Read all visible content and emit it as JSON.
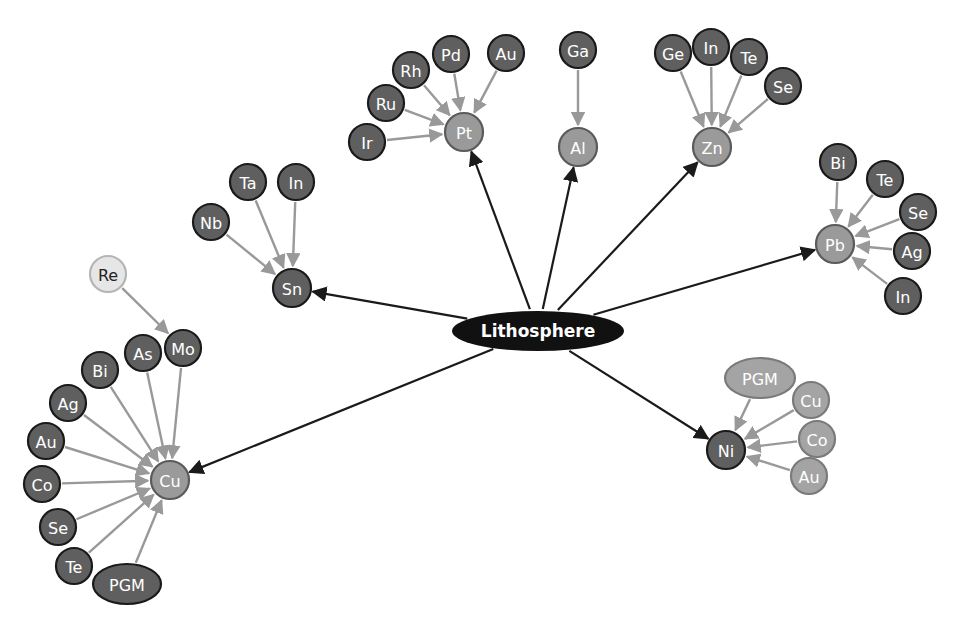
{
  "colors": {
    "hub_fill": "#111111",
    "primary_fill": "#9a9a9a",
    "primary_stroke": "#5a5a5a",
    "byproduct_dark_fill": "#5f5f5f",
    "byproduct_light_fill": "#a4a4a4",
    "byproduct_lighter_fill": "#e6e6e6",
    "node_stroke": "#1a1a1a",
    "hub_edge": "#1a1a1a",
    "child_edge": "#999999"
  },
  "hub": {
    "id": "lithosphere",
    "label": "Lithosphere",
    "x": 538,
    "y": 331,
    "rx": 86,
    "ry": 20
  },
  "primary_metals": [
    {
      "id": "pt",
      "label": "Pt",
      "x": 464,
      "y": 132,
      "r": 19,
      "style": "primary"
    },
    {
      "id": "al",
      "label": "Al",
      "x": 578,
      "y": 147,
      "r": 19,
      "style": "primary"
    },
    {
      "id": "zn",
      "label": "Zn",
      "x": 712,
      "y": 147,
      "r": 19,
      "style": "primary"
    },
    {
      "id": "pb",
      "label": "Pb",
      "x": 835,
      "y": 244,
      "r": 19,
      "style": "primary"
    },
    {
      "id": "ni",
      "label": "Ni",
      "x": 726,
      "y": 450,
      "r": 19,
      "style": "dark"
    },
    {
      "id": "cu",
      "label": "Cu",
      "x": 170,
      "y": 480,
      "r": 19,
      "style": "primary"
    },
    {
      "id": "sn",
      "label": "Sn",
      "x": 292,
      "y": 288,
      "r": 19,
      "style": "dark"
    }
  ],
  "byproducts": [
    {
      "parent": "pt",
      "label": "Ir",
      "x": 367,
      "y": 142,
      "style": "dark"
    },
    {
      "parent": "pt",
      "label": "Ru",
      "x": 386,
      "y": 103,
      "style": "dark"
    },
    {
      "parent": "pt",
      "label": "Rh",
      "x": 411,
      "y": 70,
      "style": "dark"
    },
    {
      "parent": "pt",
      "label": "Pd",
      "x": 451,
      "y": 54,
      "style": "dark"
    },
    {
      "parent": "pt",
      "label": "Au",
      "x": 506,
      "y": 53,
      "style": "dark"
    },
    {
      "parent": "al",
      "label": "Ga",
      "x": 578,
      "y": 50,
      "style": "dark"
    },
    {
      "parent": "zn",
      "label": "Ge",
      "x": 673,
      "y": 53,
      "style": "dark"
    },
    {
      "parent": "zn",
      "label": "In",
      "x": 711,
      "y": 47,
      "style": "dark"
    },
    {
      "parent": "zn",
      "label": "Te",
      "x": 749,
      "y": 57,
      "style": "dark"
    },
    {
      "parent": "zn",
      "label": "Se",
      "x": 783,
      "y": 86,
      "style": "dark"
    },
    {
      "parent": "pb",
      "label": "Bi",
      "x": 838,
      "y": 162,
      "style": "dark"
    },
    {
      "parent": "pb",
      "label": "Te",
      "x": 885,
      "y": 179,
      "style": "dark"
    },
    {
      "parent": "pb",
      "label": "Se",
      "x": 918,
      "y": 212,
      "style": "dark"
    },
    {
      "parent": "pb",
      "label": "Ag",
      "x": 912,
      "y": 251,
      "style": "dark"
    },
    {
      "parent": "pb",
      "label": "In",
      "x": 903,
      "y": 296,
      "style": "dark"
    },
    {
      "parent": "ni",
      "label": "PGM",
      "x": 760,
      "y": 378,
      "style": "light",
      "shape": "ellipse",
      "rx": 35,
      "ry": 20
    },
    {
      "parent": "ni",
      "label": "Cu",
      "x": 811,
      "y": 400,
      "style": "light"
    },
    {
      "parent": "ni",
      "label": "Co",
      "x": 817,
      "y": 439,
      "style": "light"
    },
    {
      "parent": "ni",
      "label": "Au",
      "x": 809,
      "y": 476,
      "style": "light"
    },
    {
      "parent": "sn",
      "label": "Nb",
      "x": 211,
      "y": 222,
      "style": "dark"
    },
    {
      "parent": "sn",
      "label": "Ta",
      "x": 248,
      "y": 182,
      "style": "dark"
    },
    {
      "parent": "sn",
      "label": "In",
      "x": 296,
      "y": 182,
      "style": "dark"
    },
    {
      "parent": "cu",
      "label": "Mo",
      "x": 183,
      "y": 348,
      "style": "dark"
    },
    {
      "parent": "cu",
      "label": "As",
      "x": 143,
      "y": 353,
      "style": "dark"
    },
    {
      "parent": "cu",
      "label": "Bi",
      "x": 100,
      "y": 370,
      "style": "dark"
    },
    {
      "parent": "cu",
      "label": "Ag",
      "x": 68,
      "y": 403,
      "style": "dark"
    },
    {
      "parent": "cu",
      "label": "Au",
      "x": 46,
      "y": 441,
      "style": "dark"
    },
    {
      "parent": "cu",
      "label": "Co",
      "x": 42,
      "y": 484,
      "style": "dark"
    },
    {
      "parent": "cu",
      "label": "Se",
      "x": 58,
      "y": 527,
      "style": "dark"
    },
    {
      "parent": "cu",
      "label": "Te",
      "x": 74,
      "y": 566,
      "style": "dark"
    },
    {
      "parent": "cu",
      "label": "PGM",
      "x": 127,
      "y": 584,
      "style": "dark",
      "shape": "ellipse",
      "rx": 34,
      "ry": 20
    }
  ],
  "secondary_byproducts": [
    {
      "parent_label": "Mo",
      "label": "Re",
      "x": 108,
      "y": 274,
      "style": "lighter"
    }
  ]
}
